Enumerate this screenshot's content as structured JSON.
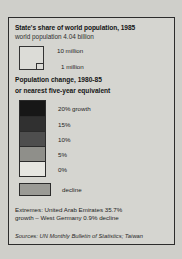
{
  "legend": {
    "title": "State's share of world population, 1985",
    "subtitle": "world population 4.04 billion",
    "size_key": {
      "big_label": "10 million",
      "small_label": "1 million"
    },
    "section_heading_line1": "Population change, 1980-85",
    "section_heading_line2": "or nearest five-year equivalent",
    "decline": {
      "label": "decline",
      "color": "#9a9a95"
    },
    "extremes_line1": "Extremes: United Arab Emirates 35.7%",
    "extremes_line2": "growth – West Germany 0.9% decline",
    "sources": "Sources: UN Monthly Bulletin of Statistics; Taiwan"
  },
  "chart_data": {
    "type": "table",
    "title": "State's share of world population, 1985",
    "subtitle": "world population 4.04 billion",
    "legend_position": "standalone-panel",
    "grid": false,
    "symbol_size_key": {
      "unit": "million people",
      "entries": [
        {
          "label": "10 million",
          "value": 10
        },
        {
          "label": "1 million",
          "value": 1
        }
      ]
    },
    "categories": [
      "20% growth",
      "15%",
      "10%",
      "5%",
      "0%",
      "decline"
    ],
    "values": [
      20,
      15,
      10,
      5,
      0,
      -1
    ],
    "colors": [
      "#171717",
      "#303030",
      "#4e4e4e",
      "#8f8f8a",
      "#e6e6e1",
      "#9a9a95"
    ],
    "xlabel": "",
    "ylabel": "Population change, 1980-85 or nearest five-year equivalent",
    "annotations": [
      "Extremes: United Arab Emirates 35.7% growth – West Germany 0.9% decline"
    ],
    "extremes": {
      "max": {
        "name": "United Arab Emirates",
        "value": 35.7,
        "direction": "growth"
      },
      "min": {
        "name": "West Germany",
        "value": 0.9,
        "direction": "decline"
      }
    },
    "world_population_billion": 4.04,
    "year": 1985,
    "period": "1980-85",
    "sources": "UN Monthly Bulletin of Statistics; Taiwan"
  }
}
